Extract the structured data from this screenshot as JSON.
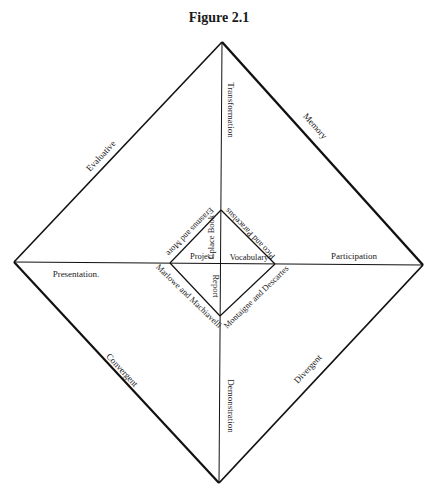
{
  "figure": {
    "title": "Figure 2.1"
  },
  "outer_diamond": {
    "edges": {
      "top_left": "Evaluative",
      "top_right": "Memory",
      "bottom_left": "Convergent",
      "bottom_right": "Divergent"
    }
  },
  "axes": {
    "top": "Transformation",
    "bottom": "Demonstration",
    "left": "Presentation.",
    "right": "Participation"
  },
  "inner_diamond": {
    "outer_edges": {
      "top_left": "Erasmus and More",
      "top_right": "Pico and Paracelsus",
      "bottom_left": "Marlowe and Machiavelli",
      "bottom_right": "Montaigne and Descartes"
    },
    "inner_labels": {
      "top": "Cplace Book",
      "left": "Project",
      "right": "Vocabulary",
      "bottom": "Report"
    }
  },
  "colors": {
    "line": "#111111",
    "text": "#1a1a1a",
    "background": "#ffffff"
  }
}
